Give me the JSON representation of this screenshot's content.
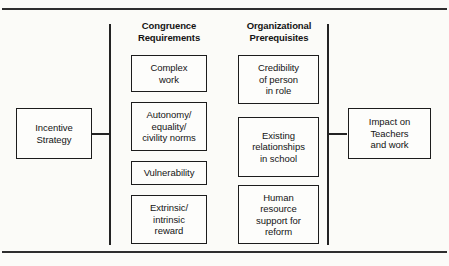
{
  "figure": {
    "type": "flow-diagram",
    "headings": [
      {
        "id": "congruence",
        "label": "Congruence\nRequirements"
      },
      {
        "id": "organization",
        "label": "Organizational\nPrerequisites"
      }
    ],
    "terminals": {
      "input": {
        "id": "incentive-strategy",
        "label": "Incentive\nStrategy"
      },
      "output": {
        "id": "impact-on-teachers",
        "label": "Impact on\nTeachers\nand work"
      }
    },
    "columns": [
      {
        "id": "congruence-requirements",
        "heading": "Congruence Requirements",
        "nodes": [
          {
            "id": "complex-work",
            "label": "Complex\nwork"
          },
          {
            "id": "autonomy-equality",
            "label": "Autonomy/\nequality/\ncivility norms"
          },
          {
            "id": "vulnerability",
            "label": "Vulnerability"
          },
          {
            "id": "extrinsic-reward",
            "label": "Extrinsic/\nintrinsic\nreward"
          }
        ]
      },
      {
        "id": "organizational-prerequisites",
        "heading": "Organizational Prerequisites",
        "nodes": [
          {
            "id": "credibility-of-person",
            "label": "Credibility\nof person\nin role"
          },
          {
            "id": "existing-relationships",
            "label": "Existing\nrelationships\nin school"
          },
          {
            "id": "human-resource-support",
            "label": "Human\nresource\nsupport for\nreform"
          }
        ]
      }
    ],
    "colors": {
      "background": "#fbfbf8",
      "stroke": "#1c1c1c",
      "rule": "#2e2e2e",
      "text": "#141414"
    }
  }
}
